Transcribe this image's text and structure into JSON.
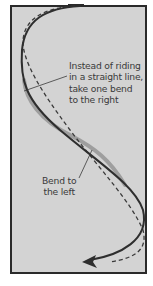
{
  "diagram": {
    "colors": {
      "background": "#d3d3d3",
      "border": "#2a2a2a",
      "path_line": "#333333",
      "path_shadow": "#8c8c8c",
      "straight_line": "#3a3a3a",
      "text": "#3a3a3a"
    },
    "annotations": {
      "right_bend": {
        "lines": [
          "Instead of riding",
          "in a straight line,",
          "take one bend",
          "to the right"
        ]
      },
      "left_bend": {
        "lines": [
          "Bend to",
          "the left"
        ]
      }
    },
    "elements": {
      "curved_path": "solid S-shaped riding line with arrowhead",
      "straight_path": "dashed reference line",
      "arrow": "arrowhead-icon"
    }
  }
}
